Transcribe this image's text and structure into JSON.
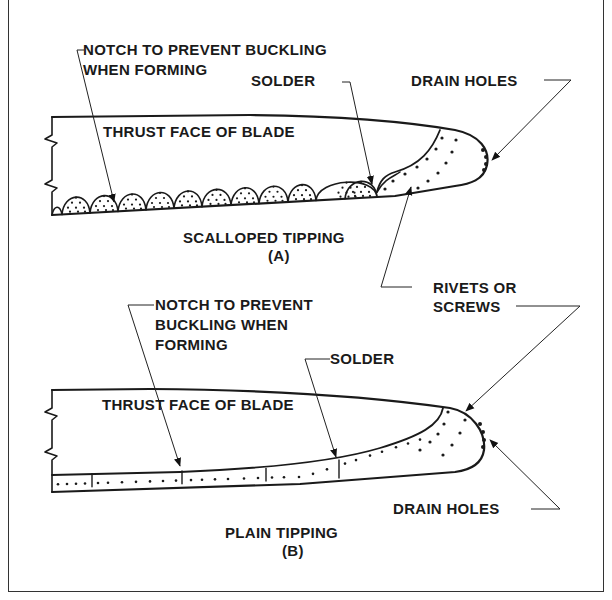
{
  "figure_a": {
    "labels": {
      "notch_line1": "NOTCH TO PREVENT BUCKLING",
      "notch_line2": "WHEN FORMING",
      "solder": "SOLDER",
      "drain_holes": "DRAIN HOLES",
      "thrust_face": "THRUST FACE OF BLADE",
      "caption": "SCALLOPED TIPPING",
      "caption_letter": "(A)"
    }
  },
  "shared": {
    "rivets_line1": "RIVETS OR",
    "rivets_line2": "SCREWS"
  },
  "figure_b": {
    "labels": {
      "notch_line1": "NOTCH TO PREVENT",
      "notch_line2": "BUCKLING WHEN",
      "notch_line3": "FORMING",
      "solder": "SOLDER",
      "thrust_face": "THRUST  FACE OF  BLADE",
      "drain_holes": "DRAIN HOLES",
      "caption": "PLAIN TIPPING",
      "caption_letter": "(B)"
    }
  }
}
